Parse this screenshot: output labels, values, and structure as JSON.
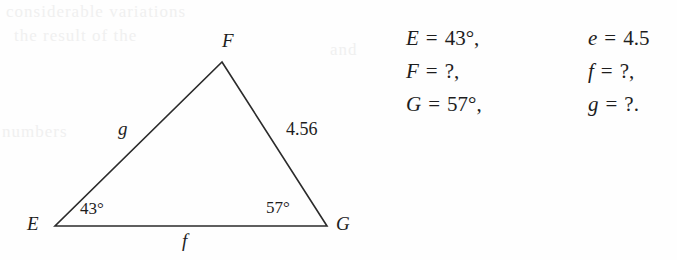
{
  "figure": {
    "shape": "triangle",
    "stroke_color": "#2b2b2b",
    "vertices": [
      {
        "name": "F",
        "label": "F",
        "x": 222,
        "y": 62
      },
      {
        "name": "G",
        "label": "G",
        "x": 327,
        "y": 226
      },
      {
        "name": "E",
        "label": "E",
        "x": 55,
        "y": 226
      }
    ],
    "vertex_labels": {
      "F": "F",
      "E": "E",
      "G": "G"
    },
    "side_labels": {
      "g": "g",
      "f": "f",
      "e_value": "4.56"
    },
    "angle_labels": {
      "E": "43°",
      "G": "57°"
    }
  },
  "equations": {
    "rows": [
      {
        "left": {
          "var": "E",
          "op": "=",
          "val": "43°,"
        },
        "right": {
          "var": "e",
          "op": "=",
          "val": "4.5"
        }
      },
      {
        "left": {
          "var": "F",
          "op": "=",
          "val": "?,"
        },
        "right": {
          "var": "f",
          "op": "=",
          "val": "?,"
        }
      },
      {
        "left": {
          "var": "G",
          "op": "=",
          "val": "57°,"
        },
        "right": {
          "var": "g",
          "op": "=",
          "val": "?."
        }
      }
    ]
  },
  "artifacts": {
    "bleed_1": "considerable variations",
    "bleed_2": "the result of the",
    "bleed_3": "numbers",
    "bleed_4": "and"
  }
}
